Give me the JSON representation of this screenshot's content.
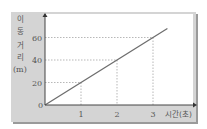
{
  "chart_data": {
    "type": "line",
    "title": "",
    "xlabel": "시간(초)",
    "ylabel": "이동 거리 (m)",
    "ylabel_lines": [
      "이",
      "동",
      "거",
      "리",
      "(m)"
    ],
    "x_ticks": [
      "0",
      "1",
      "2",
      "3"
    ],
    "y_ticks": [
      "20",
      "40",
      "60"
    ],
    "xlim": [
      0,
      3.6
    ],
    "ylim": [
      0,
      72
    ],
    "grid": false,
    "guide_lines": "dashed from points (1,20),(2,40),(3,60) to axes",
    "series": [
      {
        "name": "이동 거리",
        "x": [
          0,
          1,
          2,
          3,
          3.4
        ],
        "values": [
          0,
          20,
          40,
          60,
          68
        ]
      }
    ],
    "colors": {
      "panel": "#d4d4d4",
      "plot_bg": "#ffffff",
      "line": "#6e6e6e",
      "axis": "#444444",
      "guide": "#888888"
    }
  }
}
